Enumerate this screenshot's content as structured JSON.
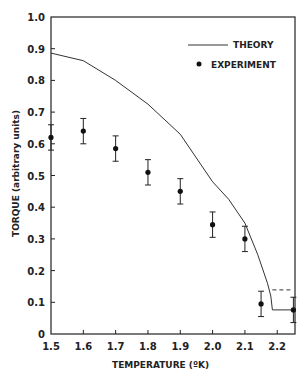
{
  "chart_data": {
    "type": "scatter",
    "title": "",
    "xlabel": "TEMPERATURE (ºK)",
    "ylabel": "TORQUE  (arbitrary units)",
    "xlim": [
      1.5,
      2.255
    ],
    "ylim": [
      0,
      1.0
    ],
    "xticks": [
      1.5,
      1.6,
      1.7,
      1.8,
      1.9,
      2.0,
      2.1,
      2.2
    ],
    "xtick_labels": [
      "1.5",
      "1.6",
      "1.7",
      "1.8",
      "1.9",
      "2.0",
      "2.1",
      "2.2"
    ],
    "yticks": [
      0,
      0.1,
      0.2,
      0.3,
      0.4,
      0.5,
      0.6,
      0.7,
      0.8,
      0.9,
      1.0
    ],
    "ytick_labels": [
      "0",
      "0.1",
      "0.2",
      "0.3",
      "0.4",
      "0.5",
      "0.6",
      "0.7",
      "0.8",
      "0.9",
      "1.0"
    ],
    "grid": false,
    "legend_position": "upper right",
    "series": [
      {
        "name": "THEORY",
        "kind": "line",
        "x": [
          1.5,
          1.6,
          1.7,
          1.8,
          1.9,
          2.0,
          2.05,
          2.1,
          2.14,
          2.17,
          2.18,
          2.185,
          2.25
        ],
        "y": [
          0.886,
          0.862,
          0.8,
          0.725,
          0.63,
          0.48,
          0.425,
          0.35,
          0.25,
          0.16,
          0.12,
          0.076,
          0.076
        ]
      },
      {
        "name": "THEORY (dashed)",
        "kind": "dashed",
        "x": [
          2.185,
          2.25
        ],
        "y": [
          0.139,
          0.139
        ]
      },
      {
        "name": "EXPERIMENT",
        "kind": "points",
        "x": [
          1.5,
          1.6,
          1.7,
          1.8,
          1.9,
          2.0,
          2.1,
          2.15,
          2.25
        ],
        "y": [
          0.62,
          0.64,
          0.585,
          0.51,
          0.45,
          0.345,
          0.3,
          0.095,
          0.076
        ],
        "err": [
          0.04,
          0.04,
          0.04,
          0.04,
          0.04,
          0.04,
          0.04,
          0.04,
          0.04
        ]
      }
    ],
    "legend": [
      {
        "label": "THEORY",
        "marker": "line"
      },
      {
        "label": "EXPERIMENT",
        "marker": "dot"
      }
    ]
  }
}
